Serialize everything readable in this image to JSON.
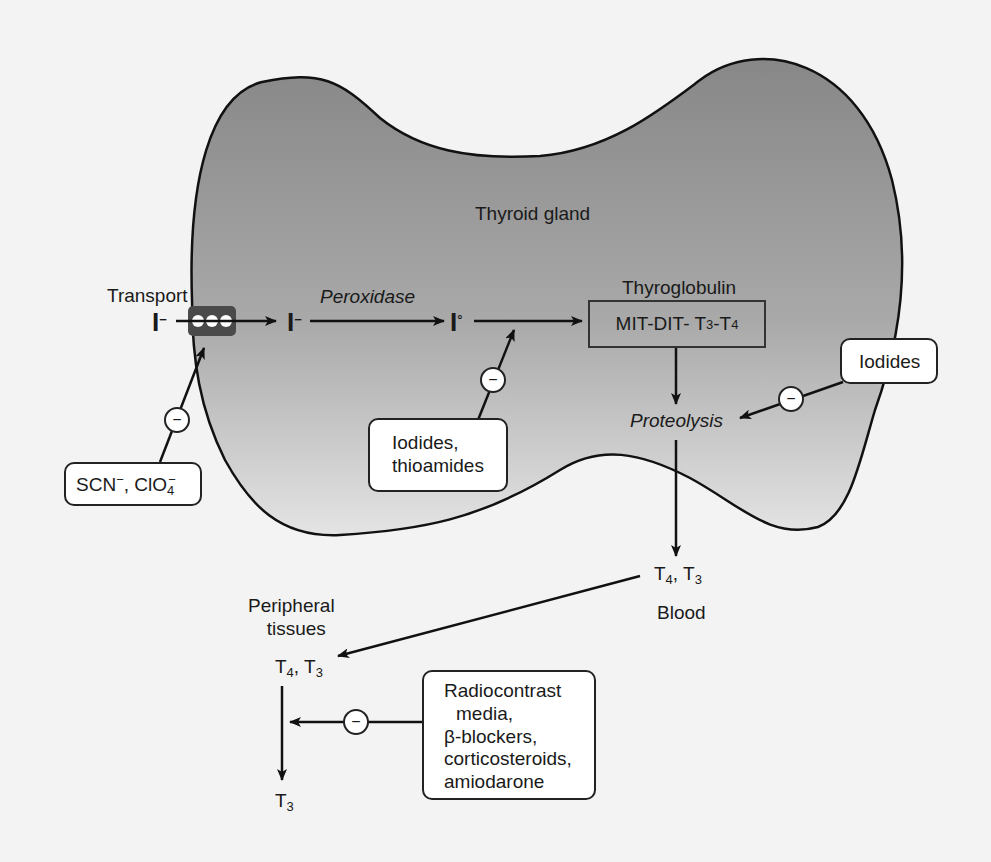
{
  "diagram": {
    "gland_label": "Thyroid gland",
    "transport_label": "Transport",
    "iodide_outside": {
      "base": "I",
      "sup": "−"
    },
    "iodide_inside": {
      "base": "I",
      "sup": "−"
    },
    "iodine_elemental": {
      "base": "I",
      "sup": "°"
    },
    "peroxidase_label": "Peroxidase",
    "thyroglobulin_label": "Thyroglobulin",
    "thyroglobulin_box": {
      "prefix": "MIT-DIT- T",
      "sub1": "3",
      "mid": "-T",
      "sub2": "4"
    },
    "proteolysis_label": "Proteolysis",
    "blood_hormones": {
      "t1": "T",
      "s1": "4",
      "sep": ", T",
      "s2": "3"
    },
    "blood_label": "Blood",
    "peripheral_label_line1": "Peripheral",
    "peripheral_label_line2": "tissues",
    "peripheral_hormones": {
      "t1": "T",
      "s1": "4",
      "sep": ", T",
      "s2": "3"
    },
    "peripheral_product": {
      "t": "T",
      "s": "3"
    },
    "inhibitor_symbol": "−",
    "inhibitors": {
      "transport": {
        "part1": "SCN",
        "sup1": "−",
        "part2": ", ClO",
        "sub2": "4",
        "sup2": "−"
      },
      "organification": {
        "line1": "Iodides,",
        "line2": "thioamides"
      },
      "proteolysis": {
        "line1": "Iodides"
      },
      "peripheral": {
        "line1": "Radiocontrast",
        "line2": "media,",
        "line3": "β-blockers,",
        "line4": "corticosteroids,",
        "line5": "amiodarone"
      }
    },
    "colors": {
      "gland_top": "#8a8a8a",
      "gland_bottom": "#e6e6e6",
      "background": "#f3f3f3",
      "stroke": "#111111",
      "transporter": "#4a4a4a"
    }
  }
}
